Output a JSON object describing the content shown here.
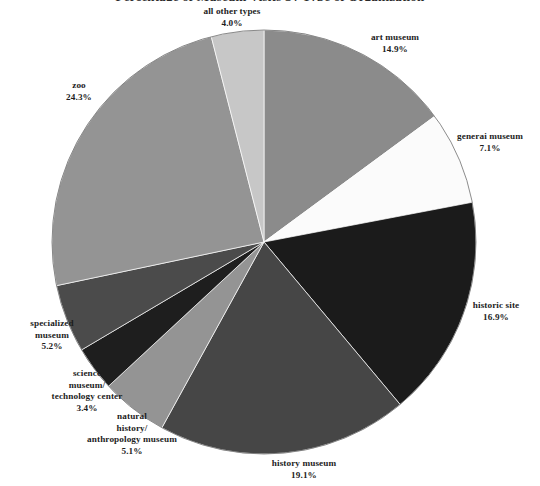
{
  "title_cropped": "Percentage of Museum Visits by Type of Organization",
  "chart_data": {
    "type": "pie",
    "title": "",
    "xlabel": "",
    "ylabel": "",
    "legend": "none",
    "start_angle_deg": 0,
    "direction": "clockwise",
    "center": {
      "x": 264,
      "y": 242
    },
    "radius": 212,
    "categories": [
      "art museum",
      "general museum",
      "historic site",
      "history museum",
      "natural history/ anthropology museum",
      "science museum/ technology center",
      "specialized museum",
      "zoo",
      "all other types"
    ],
    "values": [
      14.9,
      7.1,
      16.9,
      19.1,
      5.1,
      3.4,
      5.2,
      24.3,
      4.0
    ],
    "slices": [
      {
        "name": "art museum",
        "label_lines": [
          "art museum"
        ],
        "percent": 14.9,
        "percent_text": "14.9%",
        "color": "#8b8b8b"
      },
      {
        "name": "general museum",
        "label_lines": [
          "generai museum"
        ],
        "percent": 7.1,
        "percent_text": "7.1%",
        "color": "#fbfbfb"
      },
      {
        "name": "historic site",
        "label_lines": [
          "historic site"
        ],
        "percent": 16.9,
        "percent_text": "16.9%",
        "color": "#1b1b1b"
      },
      {
        "name": "history museum",
        "label_lines": [
          "history museum"
        ],
        "percent": 19.1,
        "percent_text": "19.1%",
        "color": "#464646"
      },
      {
        "name": "natural history/ anthropology museum",
        "label_lines": [
          "natural",
          "history/",
          "anthropology museum"
        ],
        "percent": 5.1,
        "percent_text": "5.1%",
        "color": "#949494"
      },
      {
        "name": "science museum/ technology center",
        "label_lines": [
          "science",
          "museum/",
          "technology center"
        ],
        "percent": 3.4,
        "percent_text": "3.4%",
        "color": "#1e1e1e"
      },
      {
        "name": "specialized museum",
        "label_lines": [
          "specialized",
          "museum"
        ],
        "percent": 5.2,
        "percent_text": "5.2%",
        "color": "#4b4b4b"
      },
      {
        "name": "zoo",
        "label_lines": [
          "zoo"
        ],
        "percent": 24.3,
        "percent_text": "24.3%",
        "color": "#949494"
      },
      {
        "name": "all other types",
        "label_lines": [
          "all other types"
        ],
        "percent": 4.0,
        "percent_text": "4.0%",
        "color": "#c7c7c7"
      }
    ]
  },
  "labels": {
    "art_museum": {
      "name": "art museum",
      "pct": "14.9%"
    },
    "general_museum": {
      "name": "generai museum",
      "pct": "7.1%"
    },
    "historic_site": {
      "name": "historic site",
      "pct": "16.9%"
    },
    "history_museum": {
      "name": "history museum",
      "pct": "19.1%"
    },
    "natural_history": {
      "line1": "natural",
      "line2": "history/",
      "line3": "anthropology museum",
      "pct": "5.1%"
    },
    "science_museum": {
      "line1": "science",
      "line2": "museum/",
      "line3": "technology center",
      "pct": "3.4%"
    },
    "specialized_museum": {
      "line1": "specialized",
      "line2": "museum",
      "pct": "5.2%"
    },
    "zoo": {
      "name": "zoo",
      "pct": "24.3%"
    },
    "all_other_types": {
      "name": "all other types",
      "pct": "4.0%"
    }
  }
}
